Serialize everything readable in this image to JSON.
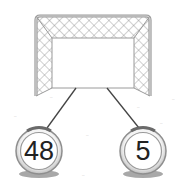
{
  "diagram": {
    "type": "number-bond",
    "goal": {
      "label": "soccer-goal"
    },
    "balls": [
      {
        "value": "48",
        "position": "left"
      },
      {
        "value": "5",
        "position": "right"
      }
    ]
  }
}
